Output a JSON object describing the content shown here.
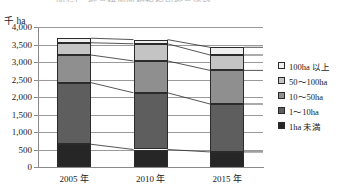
{
  "chart_data": {
    "type": "bar",
    "stacked": true,
    "title": "図4-1　経営耕地面積規模別経営体数",
    "unit_label": "千 ha",
    "xlabel": "",
    "ylabel": "千 ha",
    "ylim": [
      0,
      4000
    ],
    "ytick_step": 500,
    "yticks": [
      0,
      500,
      1000,
      1500,
      2000,
      2500,
      3000,
      3500,
      4000
    ],
    "ytick_labels": [
      "0",
      "500",
      "1,000",
      "1,500",
      "2,000",
      "2,500",
      "3,000",
      "3,500",
      "4,000"
    ],
    "categories": [
      "2005 年",
      "2010 年",
      "2015 年"
    ],
    "grid": true,
    "legend_position": "right",
    "connectors": true,
    "series": [
      {
        "name": "1ha 未満",
        "color": "#262626",
        "legend_index": 4,
        "values": [
          650,
          500,
          430
        ]
      },
      {
        "name": "1～10ha",
        "color": "#5e5e5e",
        "legend_index": 3,
        "values": [
          1760,
          1620,
          1370
        ]
      },
      {
        "name": "10～50ha",
        "color": "#8f8f8f",
        "legend_index": 2,
        "values": [
          790,
          910,
          960
        ]
      },
      {
        "name": "50～100ha",
        "color": "#c4c4c4",
        "legend_index": 1,
        "values": [
          350,
          490,
          440
        ]
      },
      {
        "name": "100ha 以上",
        "color": "#efefef",
        "legend_index": 0,
        "values": [
          130,
          120,
          220
        ]
      }
    ],
    "totals": [
      3680,
      3640,
      3420
    ],
    "legend": [
      {
        "label": "100ha 以上",
        "color": "#efefef"
      },
      {
        "label": "50～100ha",
        "color": "#c4c4c4"
      },
      {
        "label": "10～50ha",
        "color": "#8f8f8f"
      },
      {
        "label": "1～10ha",
        "color": "#5e5e5e"
      },
      {
        "label": "1ha 未満",
        "color": "#262626"
      }
    ]
  }
}
